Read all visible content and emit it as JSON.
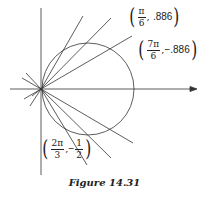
{
  "figure": {
    "caption": "Figure 14.31",
    "labels": [
      {
        "id": "pi6",
        "num": "π",
        "den": "6",
        "sep": ",",
        "value": ".886"
      },
      {
        "id": "7pi6",
        "num": "7π",
        "den": "6",
        "sep": ",",
        "value": "−.886"
      },
      {
        "id": "2pi3",
        "num": "2π",
        "den": "3",
        "sep": ",",
        "value_sign": "−",
        "value_num": "1",
        "value_den": "2"
      }
    ]
  },
  "colors": {
    "stroke": "#333333",
    "text": "#222222",
    "background": "#ffffff"
  }
}
